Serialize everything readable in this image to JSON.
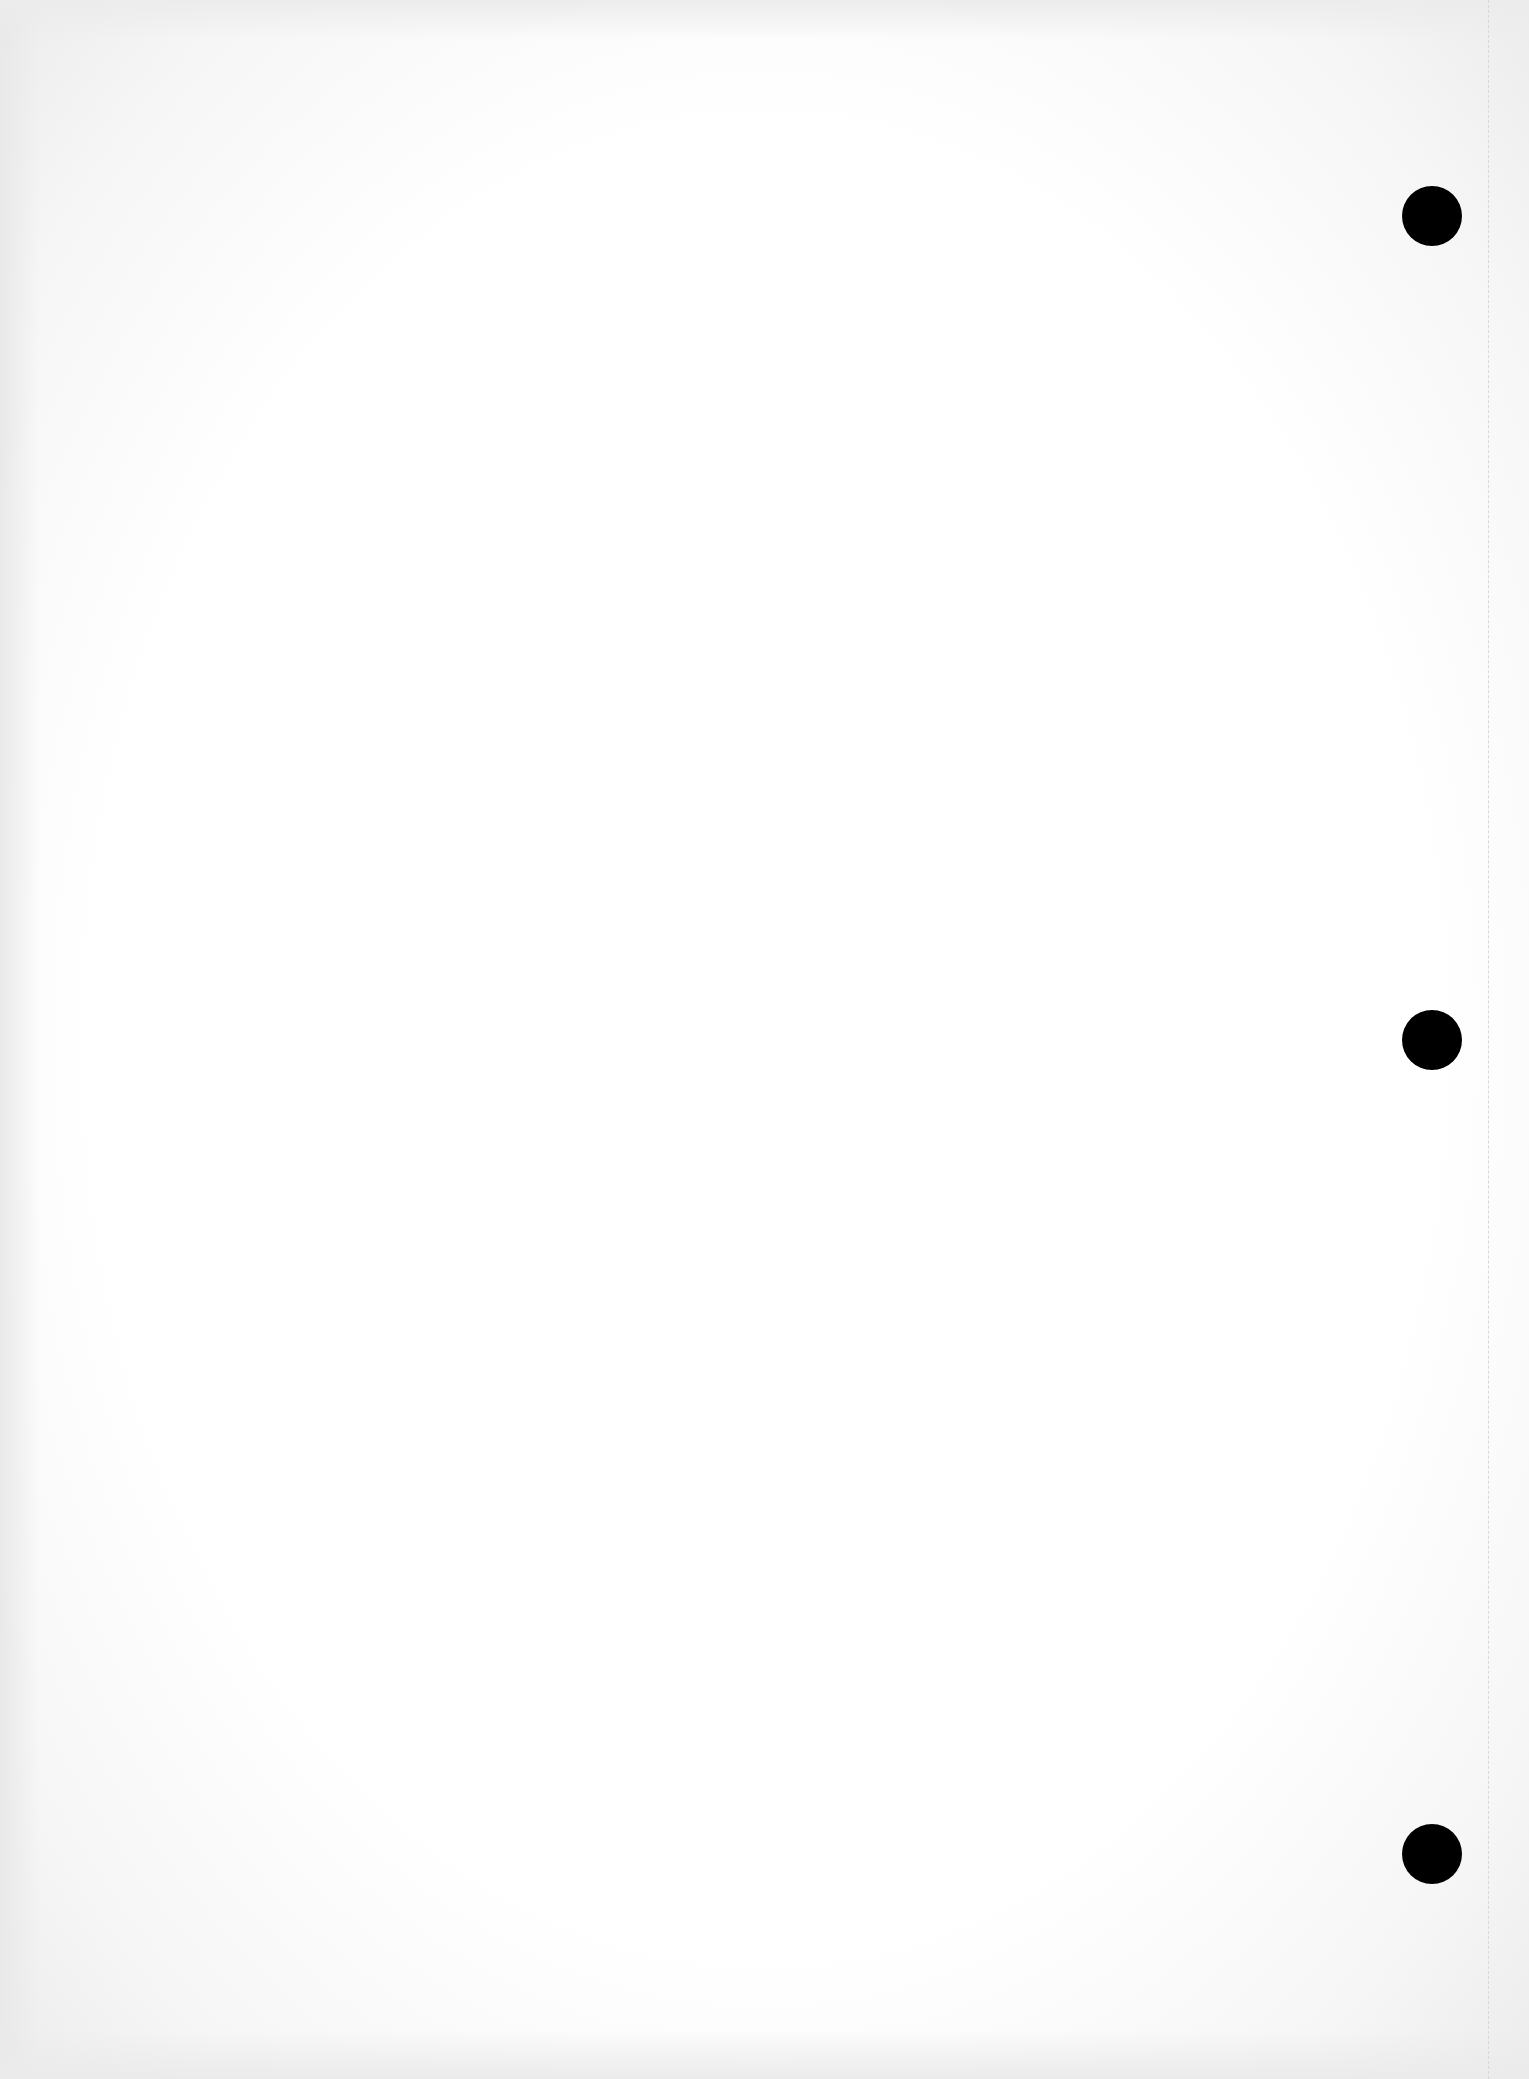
{
  "document": {
    "type": "blank scanned page",
    "background_color": "#ffffff",
    "edge_shade_color": "#ececec",
    "legible_text": []
  },
  "perforation": {
    "x": 1488,
    "color": "#d8d8d8",
    "style": "dashed"
  },
  "punch_holes": [
    {
      "cx": 1432,
      "cy": 216,
      "diameter": 60,
      "color": "#000000"
    },
    {
      "cx": 1432,
      "cy": 1040,
      "diameter": 60,
      "color": "#000000"
    },
    {
      "cx": 1432,
      "cy": 1854,
      "diameter": 60,
      "color": "#000000"
    }
  ]
}
